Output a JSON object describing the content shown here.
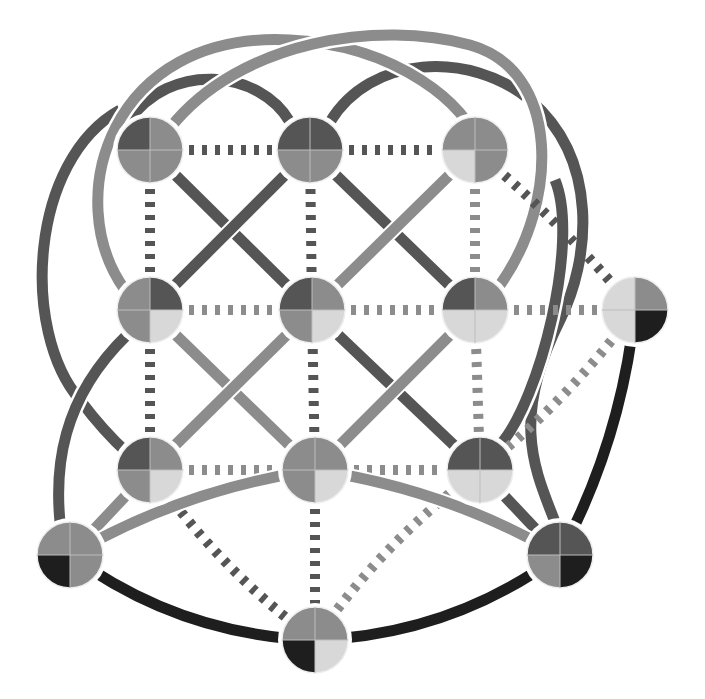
{
  "diagram": {
    "type": "network-graph",
    "width": 705,
    "height": 699,
    "palette": {
      "black": "#1e1e1e",
      "dark": "#555555",
      "mid": "#8c8c8c",
      "light": "#d8d8d8",
      "background": "#ffffff"
    },
    "node_radius": 33,
    "nodes": [
      {
        "id": "n1",
        "x": 150,
        "y": 150,
        "q": [
          "dark",
          "mid",
          "mid",
          "mid"
        ]
      },
      {
        "id": "n2",
        "x": 310,
        "y": 150,
        "q": [
          "dark",
          "dark",
          "mid",
          "mid"
        ]
      },
      {
        "id": "n3",
        "x": 475,
        "y": 150,
        "q": [
          "mid",
          "mid",
          "mid",
          "light"
        ]
      },
      {
        "id": "n4",
        "x": 150,
        "y": 310,
        "q": [
          "mid",
          "dark",
          "light",
          "mid"
        ]
      },
      {
        "id": "n5",
        "x": 312,
        "y": 310,
        "q": [
          "dark",
          "mid",
          "light",
          "mid"
        ]
      },
      {
        "id": "n6",
        "x": 475,
        "y": 310,
        "q": [
          "dark",
          "mid",
          "light",
          "light"
        ]
      },
      {
        "id": "n7",
        "x": 635,
        "y": 310,
        "q": [
          "light",
          "mid",
          "black",
          "light"
        ]
      },
      {
        "id": "n8",
        "x": 150,
        "y": 470,
        "q": [
          "dark",
          "mid",
          "light",
          "mid"
        ]
      },
      {
        "id": "n9",
        "x": 315,
        "y": 470,
        "q": [
          "mid",
          "mid",
          "light",
          "mid"
        ]
      },
      {
        "id": "n10",
        "x": 480,
        "y": 470,
        "q": [
          "dark",
          "dark",
          "light",
          "light"
        ]
      },
      {
        "id": "n11",
        "x": 70,
        "y": 555,
        "q": [
          "mid",
          "mid",
          "mid",
          "black"
        ]
      },
      {
        "id": "n12",
        "x": 560,
        "y": 555,
        "q": [
          "dark",
          "dark",
          "black",
          "mid"
        ]
      },
      {
        "id": "n13",
        "x": 315,
        "y": 640,
        "q": [
          "mid",
          "mid",
          "light",
          "black"
        ]
      }
    ],
    "edges": [
      {
        "from": "n1",
        "to": "n2",
        "style": "dashed",
        "shade": "dark"
      },
      {
        "from": "n2",
        "to": "n3",
        "style": "dashed",
        "shade": "dark"
      },
      {
        "from": "n1",
        "to": "n4",
        "style": "dashed",
        "shade": "dark"
      },
      {
        "from": "n2",
        "to": "n5",
        "style": "dashed",
        "shade": "dark"
      },
      {
        "from": "n3",
        "to": "n6",
        "style": "dashed",
        "shade": "mid"
      },
      {
        "from": "n4",
        "to": "n5",
        "style": "dashed",
        "shade": "mid"
      },
      {
        "from": "n5",
        "to": "n6",
        "style": "dashed",
        "shade": "mid"
      },
      {
        "from": "n6",
        "to": "n7",
        "style": "dashed",
        "shade": "mid"
      },
      {
        "from": "n4",
        "to": "n8",
        "style": "dashed",
        "shade": "dark"
      },
      {
        "from": "n5",
        "to": "n9",
        "style": "dashed",
        "shade": "dark"
      },
      {
        "from": "n6",
        "to": "n10",
        "style": "dashed",
        "shade": "mid"
      },
      {
        "from": "n8",
        "to": "n9",
        "style": "dashed",
        "shade": "mid"
      },
      {
        "from": "n9",
        "to": "n10",
        "style": "dashed",
        "shade": "mid"
      },
      {
        "from": "n9",
        "to": "n13",
        "style": "dashed",
        "shade": "dark"
      },
      {
        "from": "n8",
        "to": "n13",
        "style": "dashed",
        "shade": "dark",
        "curve": 20
      },
      {
        "from": "n3",
        "to": "n7",
        "style": "dashed",
        "shade": "dark",
        "curve": -10
      },
      {
        "from": "n7",
        "to": "n10",
        "style": "dashed",
        "shade": "mid",
        "curve": -15
      },
      {
        "from": "n10",
        "to": "n13",
        "style": "dashed",
        "shade": "mid",
        "curve": 20
      },
      {
        "from": "n1",
        "to": "n5",
        "style": "solid",
        "shade": "dark"
      },
      {
        "from": "n2",
        "to": "n4",
        "style": "solid",
        "shade": "dark"
      },
      {
        "from": "n2",
        "to": "n6",
        "style": "solid",
        "shade": "dark"
      },
      {
        "from": "n3",
        "to": "n5",
        "style": "solid",
        "shade": "mid"
      },
      {
        "from": "n4",
        "to": "n9",
        "style": "solid",
        "shade": "mid"
      },
      {
        "from": "n5",
        "to": "n8",
        "style": "solid",
        "shade": "mid"
      },
      {
        "from": "n5",
        "to": "n10",
        "style": "solid",
        "shade": "dark"
      },
      {
        "from": "n6",
        "to": "n9",
        "style": "solid",
        "shade": "mid"
      },
      {
        "from": "n8",
        "to": "n11",
        "style": "solid",
        "shade": "mid"
      },
      {
        "from": "n10",
        "to": "n12",
        "style": "solid",
        "shade": "dark"
      },
      {
        "from": "n11",
        "to": "n13",
        "style": "solid",
        "shade": "black",
        "curve": 40
      },
      {
        "from": "n13",
        "to": "n12",
        "style": "solid",
        "shade": "black",
        "curve": 40
      },
      {
        "from": "n7",
        "to": "n12",
        "style": "solid",
        "shade": "black",
        "curve": -25
      },
      {
        "from": "n11",
        "to": "n9",
        "style": "solid",
        "shade": "mid",
        "curve": -25
      },
      {
        "from": "n9",
        "to": "n12",
        "style": "solid",
        "shade": "mid",
        "curve": -25
      }
    ],
    "arcs": [
      {
        "name": "arc-n1-n2-top",
        "shade": "dark",
        "d": "M 128 122 C 170 60, 260 70, 290 122"
      },
      {
        "name": "arc-n2-n3-top",
        "shade": "dark",
        "d": "M 330 122 C 370 55, 470 50, 530 100"
      },
      {
        "name": "arc-outer-left",
        "shade": "dark",
        "d": "M 120 110 C 30 160, 20 330, 80 400 C 110 440, 125 450, 135 460"
      },
      {
        "name": "arc-outer-right",
        "shade": "dark",
        "d": "M 530 100 C 600 160, 590 260, 560 320 C 510 420, 535 470, 555 522"
      },
      {
        "name": "arc-big-left",
        "shade": "mid",
        "d": "M 125 290 C 60 200, 110 30, 290 40 C 400 45, 470 110, 475 140"
      },
      {
        "name": "arc-big-right",
        "shade": "mid",
        "d": "M 170 128 C 240 40, 380 20, 470 45 C 560 70, 560 200, 500 285"
      },
      {
        "name": "arc-left-low",
        "shade": "dark",
        "d": "M 127 335 C 60 400, 55 470, 60 522"
      },
      {
        "name": "arc-right-low",
        "shade": "dark",
        "d": "M 555 180 C 580 240, 540 400, 500 445"
      }
    ]
  }
}
